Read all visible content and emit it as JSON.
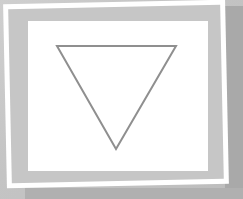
{
  "scene": {
    "description": "Framed picture of an inverted triangle outline",
    "colors": {
      "background": "#c4c4c4",
      "frame_border": "#ffffff",
      "mat": "#c6c6c6",
      "panel": "#ffffff",
      "triangle_stroke": "#8f8f8f",
      "shadow": "#a9a9a9"
    },
    "triangle": {
      "orientation": "inverted",
      "points": [
        [
          57,
          46
        ],
        [
          176,
          46
        ],
        [
          116,
          149
        ]
      ],
      "stroke_width": 2
    }
  }
}
